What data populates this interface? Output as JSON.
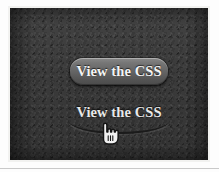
{
  "canvas": {
    "width": 219,
    "height": 172,
    "page_background": "#fdfdfd",
    "panel_background": "#3a3a3a",
    "panel_frame_color": "#f2f2f0",
    "bottom_rule_color": "#c9c9c9"
  },
  "demo": {
    "buttons": [
      {
        "id": "raised",
        "label": "View the CSS",
        "style": "raised-rounded-pill",
        "text_color": "#f4f4f4",
        "fill_top": "#8a8a8a",
        "fill_bottom": "#4b4b4b",
        "corner_radius_px": 13
      },
      {
        "id": "flat",
        "label": "View the CSS",
        "style": "flat-with-curved-underline",
        "text_color": "#e9e9e9",
        "underline_color": "#1b1b1b"
      }
    ]
  },
  "cursor": {
    "type": "pointing-hand",
    "fill": "#f0f0f0",
    "outline": "#141414",
    "x": 90,
    "y": 114
  }
}
